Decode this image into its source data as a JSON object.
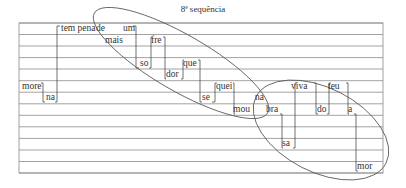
{
  "title": "8ª sequência",
  "staff": {
    "x0": 19,
    "x1": 383,
    "lines_y": [
      23,
      34.5,
      46,
      57.6,
      69,
      80.7,
      92.2,
      103.8,
      115.3,
      126.8,
      138.4,
      150,
      161.5,
      173
    ]
  },
  "colors": {
    "line": "#8a8a8a",
    "ink": "#333333",
    "ellipse": "#555555"
  },
  "words": [
    {
      "text": "more",
      "x": 22,
      "y": 90
    },
    {
      "text": "na",
      "x": 46,
      "y": 101
    },
    {
      "text": "tem pena",
      "x": 61,
      "y": 32
    },
    {
      "text": "de",
      "x": 96,
      "y": 32
    },
    {
      "text": "mais",
      "x": 105,
      "y": 44
    },
    {
      "text": "um",
      "x": 123,
      "y": 32
    },
    {
      "text": "so",
      "x": 140,
      "y": 67
    },
    {
      "text": "fre",
      "x": 151,
      "y": 44
    },
    {
      "text": "dor",
      "x": 166,
      "y": 78
    },
    {
      "text": "que",
      "x": 183,
      "y": 67
    },
    {
      "text": "se",
      "x": 202,
      "y": 101
    },
    {
      "text": "quei",
      "x": 216,
      "y": 90
    },
    {
      "text": "mou",
      "x": 233,
      "y": 113
    },
    {
      "text": "na",
      "x": 255,
      "y": 101
    },
    {
      "text": "bra",
      "x": 266,
      "y": 113
    },
    {
      "text": "sa",
      "x": 282,
      "y": 147
    },
    {
      "text": "viva",
      "x": 291,
      "y": 90
    },
    {
      "text": "do",
      "x": 317,
      "y": 113
    },
    {
      "text": "teu",
      "x": 328,
      "y": 90
    },
    {
      "text": "a",
      "x": 348,
      "y": 113
    },
    {
      "text": "mor",
      "x": 357,
      "y": 170
    }
  ],
  "connectors": [
    "41,83 43,83 43,102 45,102",
    "55,102 57,102 57,26 60,26",
    "133,26 136,26 136,68 139,68",
    "149,68 151,68 151,37 152,37",
    "163,37 165,37 165,79 166,79",
    "181,79 183,79 183,60 184,60",
    "198,60 200,60 200,102 202,102",
    "212,102 215,102 215,83 217,83",
    "233,83 234,83 234,114 235,114",
    "280,114 282,114 282,148 283,148",
    "293,148 295,148 295,83 297,83",
    "314,83 316,83 316,114 318,114",
    "327,114 329,114 329,83 331,83",
    "346,83 348,83 348,114 349,114",
    "354,114 356,114 356,171 358,171"
  ],
  "ellipses": [
    {
      "cx": 181,
      "cy": 63,
      "rx": 100,
      "ry": 28,
      "rotate": 30
    },
    {
      "cx": 321,
      "cy": 130,
      "rx": 73,
      "ry": 42,
      "rotate": 27
    }
  ]
}
